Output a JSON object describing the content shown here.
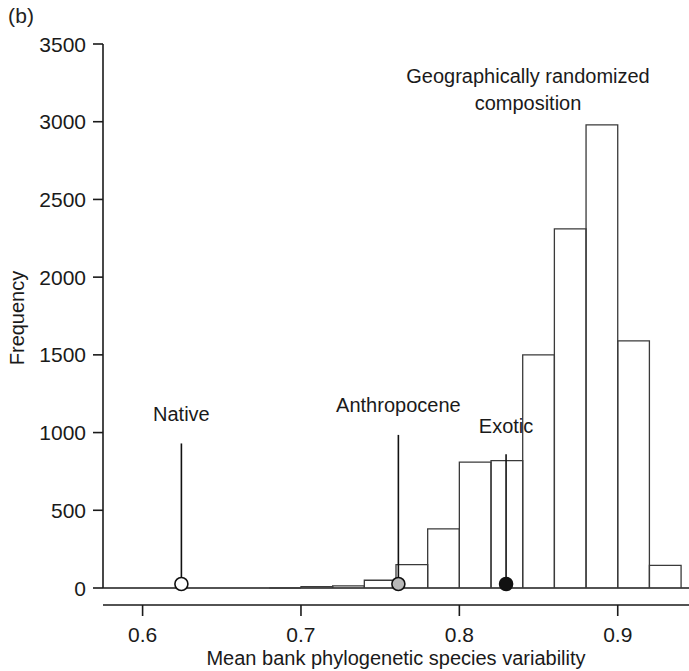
{
  "figure": {
    "panel_label": "(b)",
    "annotation_line1": "Geographically randomized",
    "annotation_line2": "composition"
  },
  "chart_data": {
    "type": "bar",
    "title": "",
    "subtitle": "",
    "xlabel": "Mean bank phylogenetic species variability",
    "ylabel": "Frequency",
    "xlim": [
      0.575,
      0.945
    ],
    "ylim": [
      0,
      3500
    ],
    "grid": false,
    "legend_position": "none",
    "xticks": [
      0.6,
      0.7,
      0.8,
      0.9
    ],
    "xticklabels": [
      "0.6",
      "0.7",
      "0.8",
      "0.9"
    ],
    "yticks": [
      0,
      500,
      1000,
      1500,
      2000,
      2500,
      3000,
      3500
    ],
    "yticklabels": [
      "0",
      "500",
      "1000",
      "1500",
      "2000",
      "2500",
      "3000",
      "3500"
    ],
    "bin_width": 0.02,
    "bin_starts": [
      0.68,
      0.7,
      0.72,
      0.74,
      0.76,
      0.78,
      0.8,
      0.82,
      0.84,
      0.86,
      0.88,
      0.9,
      0.92
    ],
    "bin_centers": [
      0.69,
      0.71,
      0.73,
      0.75,
      0.77,
      0.79,
      0.81,
      0.83,
      0.85,
      0.87,
      0.89,
      0.91,
      0.93
    ],
    "values": [
      0,
      8,
      14,
      50,
      150,
      380,
      810,
      820,
      1500,
      2310,
      2980,
      1590,
      145
    ],
    "annotations": [
      {
        "name": "geographically-randomized-composition",
        "text_line1": "Geographically randomized",
        "text_line2": "composition",
        "x": 0.862,
        "y": 3260
      }
    ],
    "markers": [
      {
        "name": "Native",
        "x": 0.6245,
        "y": 0,
        "style": "open-circle",
        "label": "Native",
        "label_y": 1075,
        "leader_top": 930
      },
      {
        "name": "Anthropocene",
        "x": 0.7615,
        "y": 0,
        "style": "grey-circle",
        "label": "Anthropocene",
        "label_y": 1130,
        "leader_top": 985
      },
      {
        "name": "Exotic",
        "x": 0.8295,
        "y": 0,
        "style": "filled-circle",
        "label": "Exotic",
        "label_y": 1000,
        "leader_top": 860
      }
    ],
    "colors": {
      "bar_stroke": "#3a3a3a",
      "bar_fill": "#ffffff",
      "axis": "#1a1a1a",
      "marker_native": "#ffffff",
      "marker_anthropocene": "#b9b9b9",
      "marker_exotic": "#111111"
    }
  }
}
